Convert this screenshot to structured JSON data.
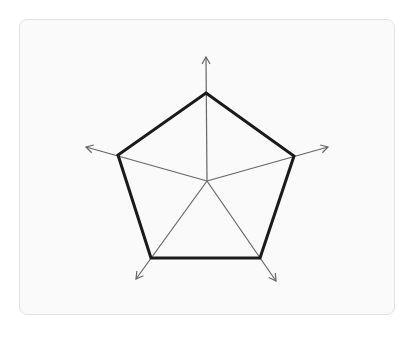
{
  "diagram": {
    "type": "radar-pentagon",
    "center": {
      "x": 207,
      "y": 181
    },
    "colors": {
      "card_background": "#fafafa",
      "card_border": "#e2e2e2",
      "polygon_stroke": "#1a1a1a",
      "axis_stroke": "#666666"
    },
    "axes": [
      {
        "name": "axis-top",
        "tip": {
          "x": 206,
          "y": 57
        }
      },
      {
        "name": "axis-right",
        "tip": {
          "x": 328,
          "y": 147
        }
      },
      {
        "name": "axis-bottom-right",
        "tip": {
          "x": 276,
          "y": 281
        }
      },
      {
        "name": "axis-bottom-left",
        "tip": {
          "x": 136,
          "y": 279
        }
      },
      {
        "name": "axis-left",
        "tip": {
          "x": 86,
          "y": 147
        }
      }
    ],
    "vertices": [
      {
        "x": 206,
        "y": 93
      },
      {
        "x": 294,
        "y": 156
      },
      {
        "x": 260,
        "y": 258
      },
      {
        "x": 151,
        "y": 258
      },
      {
        "x": 118,
        "y": 155
      }
    ]
  }
}
